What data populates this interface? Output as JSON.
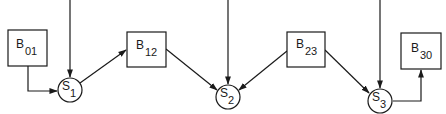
{
  "diagram": {
    "colors": {
      "line": "#1a1a1a",
      "background": "#ffffff"
    },
    "boxes": [
      {
        "id": "B01",
        "letter": "B",
        "subscript": "01"
      },
      {
        "id": "B12",
        "letter": "B",
        "subscript": "12"
      },
      {
        "id": "B23",
        "letter": "B",
        "subscript": "23"
      },
      {
        "id": "B30",
        "letter": "B",
        "subscript": "30"
      }
    ],
    "circles": [
      {
        "id": "S1",
        "letter": "S",
        "subscript": "1"
      },
      {
        "id": "S2",
        "letter": "S",
        "subscript": "2"
      },
      {
        "id": "S3",
        "letter": "S",
        "subscript": "3"
      }
    ],
    "edges": [
      {
        "from": "top",
        "to": "S1"
      },
      {
        "from": "B01",
        "to": "S1"
      },
      {
        "from": "S1",
        "to": "B12"
      },
      {
        "from": "top",
        "to": "S2"
      },
      {
        "from": "B12",
        "to": "S2"
      },
      {
        "from": "B23",
        "to": "S2"
      },
      {
        "from": "top",
        "to": "S3"
      },
      {
        "from": "B23",
        "to": "S3"
      },
      {
        "from": "S3",
        "to": "B30"
      }
    ]
  }
}
